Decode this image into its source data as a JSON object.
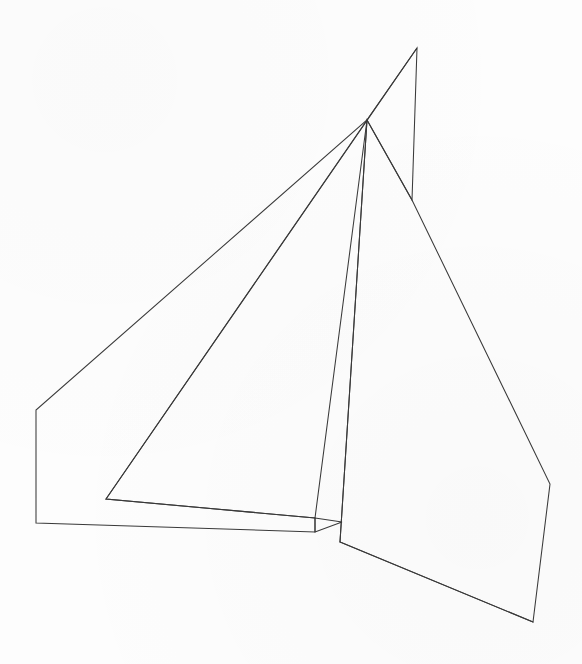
{
  "document": {
    "title": "Sail plan line drawing",
    "subject": "sailboat-sails",
    "background_color": "#fdfdfd",
    "stroke_color": "#3a3a3a",
    "width": 582,
    "height": 664
  },
  "drawing": {
    "description": "Monochrome outline drawing of three sail panels converging at a masthead point",
    "shapes": [
      {
        "name": "headsail-panel",
        "label": "Large left foresail / genoa panel",
        "closed": true,
        "points": "417,48 367,120 36,410 36,523 315,532 315,518 106,499"
      },
      {
        "name": "staysail-panel",
        "label": "Inner triangular staysail panel",
        "closed": true,
        "points": "367,120 106,499 315,518"
      },
      {
        "name": "mainsail-panel",
        "label": "Right mainsail panel",
        "closed": true,
        "points": "367,120 412,200 550,484 533,622 340,542"
      },
      {
        "name": "mast-leech-panel",
        "label": "Narrow mast-head sliver between apex and masthead",
        "closed": true,
        "points": "417,48 412,200 367,120"
      },
      {
        "name": "mainsail-luff-edge",
        "label": "Mainsail luff from masthead to tack",
        "closed": false,
        "points": "367,120 340,542"
      },
      {
        "name": "foot-notch",
        "label": "Small foot notch wedge at clew of foresail",
        "closed": true,
        "points": "315,518 342,522 315,532"
      },
      {
        "name": "mainsail-foot-edge",
        "label": "Mainsail foot from tack to clew",
        "closed": false,
        "points": "340,542 533,622"
      }
    ],
    "vertices": [
      {
        "name": "masthead-apex",
        "x": 417,
        "y": 48
      },
      {
        "name": "halyard-node",
        "x": 367,
        "y": 120
      },
      {
        "name": "mast-collar",
        "x": 412,
        "y": 200
      },
      {
        "name": "foresail-head-left",
        "x": 36,
        "y": 410
      },
      {
        "name": "foresail-tack-left",
        "x": 36,
        "y": 523
      },
      {
        "name": "staysail-tack",
        "x": 106,
        "y": 499
      },
      {
        "name": "foresail-clew-upper",
        "x": 315,
        "y": 518
      },
      {
        "name": "foresail-clew-lower",
        "x": 315,
        "y": 532
      },
      {
        "name": "mainsail-tack",
        "x": 340,
        "y": 542
      },
      {
        "name": "boom-end",
        "x": 342,
        "y": 522
      },
      {
        "name": "mainsail-leech-bend",
        "x": 550,
        "y": 484
      },
      {
        "name": "mainsail-clew",
        "x": 533,
        "y": 622
      }
    ]
  }
}
